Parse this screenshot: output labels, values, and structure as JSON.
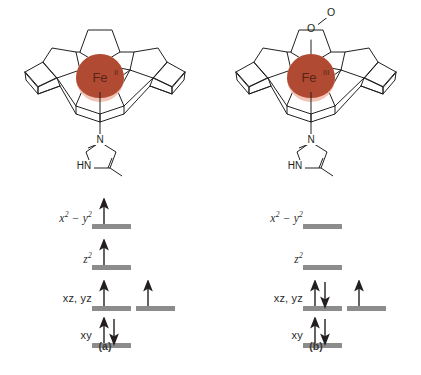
{
  "figure": {
    "caption_a": "(a)",
    "caption_b": "(b)",
    "background": "#ffffff",
    "iron_color": "#b04a32",
    "iron_highlight": "#f3c3b6",
    "bar_color": "#8c8c8c",
    "line_color": "#231f20"
  },
  "panels": [
    {
      "id": "a",
      "caption": "(a)",
      "metal_label": "Fe",
      "metal_oxidation": "II",
      "axial_ligand_top": null,
      "axial_ligand_bottom": {
        "name": "imidazole",
        "atoms": [
          "N",
          "HN"
        ],
        "n_label": "N",
        "hn_label": "HN"
      },
      "spin_state": "high-spin",
      "d_electron_count": 6,
      "orbitals": [
        {
          "label": "x",
          "label_sup": "2",
          "label_rest": " − y",
          "label_sup2": "2",
          "display": "x² − y²",
          "style": "italic",
          "electrons": [
            1
          ],
          "spins": [
            "up"
          ]
        },
        {
          "label": "z",
          "label_sup": "2",
          "display": "z²",
          "style": "italic",
          "electrons": [
            1
          ],
          "spins": [
            "up"
          ]
        },
        {
          "display": "xz, yz",
          "style": "upright",
          "degenerate": true,
          "electrons": [
            1,
            1
          ],
          "spins": [
            "up",
            "up"
          ]
        },
        {
          "display": "xy",
          "style": "upright",
          "electrons": [
            2
          ],
          "spins": [
            "updown"
          ]
        }
      ]
    },
    {
      "id": "b",
      "caption": "(b)",
      "metal_label": "Fe",
      "metal_oxidation": "III",
      "axial_ligand_top": {
        "name": "superoxide",
        "atoms": [
          "O",
          "O"
        ],
        "o_lower_label": "O",
        "o_upper_label": "O"
      },
      "axial_ligand_bottom": {
        "name": "imidazole",
        "atoms": [
          "N",
          "HN"
        ],
        "n_label": "N",
        "hn_label": "HN"
      },
      "spin_state": "low-spin",
      "d_electron_count": 5,
      "orbitals": [
        {
          "display": "x² − y²",
          "style": "italic",
          "electrons": [
            0
          ],
          "spins": []
        },
        {
          "display": "z²",
          "style": "italic",
          "electrons": [
            0
          ],
          "spins": []
        },
        {
          "display": "xz, yz",
          "style": "upright",
          "degenerate": true,
          "electrons": [
            2,
            1
          ],
          "spins": [
            "updown",
            "up"
          ]
        },
        {
          "display": "xy",
          "style": "upright",
          "electrons": [
            2
          ],
          "spins": [
            "updown"
          ]
        }
      ]
    }
  ],
  "orbital_label_texts": {
    "x2y2": "x2 − y2",
    "z2": "z2",
    "xzyz": "xz, yz",
    "xy": "xy"
  }
}
